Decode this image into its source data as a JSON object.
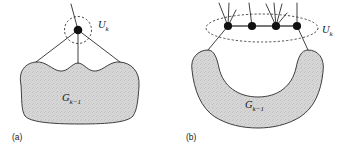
{
  "figure": {
    "background_color": "#ffffff",
    "ink_color": "#2b2b2b",
    "blob_fill_color": "#d3d3d3",
    "node_color": "#111111"
  },
  "panels": [
    {
      "id": "a",
      "caption": "(a)",
      "set_label": {
        "base": "U",
        "subscript": "k"
      },
      "region_label": {
        "base": "G",
        "subscript": "k−1"
      },
      "node_count": 1,
      "description": "single vertex Uk enclosed in dashed circle above shaded region G k-1 with three descending edges and one ascending edge"
    },
    {
      "id": "b",
      "caption": "(b)",
      "set_label": {
        "base": "U",
        "subscript": "k"
      },
      "region_label": {
        "base": "G",
        "subscript": "k−1"
      },
      "node_count": 4,
      "description": "four vertices in a horizontal path enclosed in dashed ellipse Uk above crescent shaped shaded region G k-1, with pendant edges rising from each vertex"
    }
  ],
  "panel_a": {
    "node": {
      "cx": 78,
      "cy": 30,
      "r": 4.3
    },
    "dashed_circle": {
      "cx": 78,
      "cy": 30,
      "rx": 13.5,
      "ry": 13.5
    },
    "uk_label_x": 98,
    "uk_label_y": 28,
    "caption_x": 12,
    "caption_y": 140,
    "region_label_x": 62,
    "region_label_y": 101
  },
  "panel_b": {
    "nodes": [
      {
        "cx": 228,
        "cy": 26,
        "r": 4.1
      },
      {
        "cx": 252,
        "cy": 26,
        "r": 4.1
      },
      {
        "cx": 276,
        "cy": 26,
        "r": 4.1
      },
      {
        "cx": 297,
        "cy": 26,
        "r": 4.1
      }
    ],
    "dashed_ellipse": {
      "cx": 262,
      "cy": 28,
      "rx": 56,
      "ry": 14
    },
    "uk_label_x": 322,
    "uk_label_y": 33,
    "caption_x": 186,
    "caption_y": 140,
    "region_label_x": 245,
    "region_label_y": 108
  }
}
